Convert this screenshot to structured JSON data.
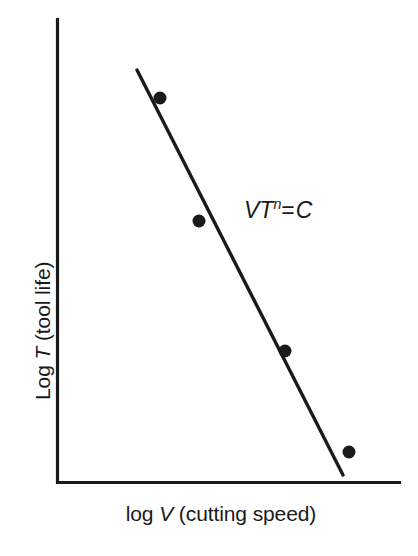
{
  "chart_data": {
    "type": "line",
    "title": "",
    "subtitle": "",
    "xlabel": "log V (cutting speed)",
    "ylabel": "Log T (tool life)",
    "xlabel_parts": {
      "prefix": "log ",
      "variable": "V",
      "suffix": " (cutting speed)"
    },
    "ylabel_parts": {
      "prefix": "Log ",
      "variable": "T",
      "suffix": " (tool life)"
    },
    "grid": false,
    "legend": null,
    "axis_ticks": {
      "x": [],
      "y": []
    },
    "axis_tick_labels": {
      "x": [],
      "y": []
    },
    "xlim": [
      0,
      1
    ],
    "ylim": [
      0,
      1
    ],
    "annotations": [
      {
        "name": "taylor-equation",
        "text": "VT^n = C",
        "parts": {
          "v": "V",
          "t": "T",
          "exponent": "n",
          "equals": "=",
          "constant": "C"
        },
        "x_px": 244,
        "y_px": 199
      }
    ],
    "series": [
      {
        "name": "fitted-trend-line",
        "type": "line",
        "style": "solid",
        "color": "#1a1a1a",
        "width_px": 3.4,
        "points_px": [
          {
            "x": 137,
            "y": 70
          },
          {
            "x": 343,
            "y": 475
          }
        ],
        "points_normalized": [
          {
            "x": 0.236,
            "y": 0.888
          },
          {
            "x": 0.833,
            "y": 0.017
          }
        ]
      },
      {
        "name": "measured-data-points",
        "type": "scatter",
        "marker": "filled-circle",
        "color": "#1a1a1a",
        "marker_size_px": 13,
        "points_px": [
          {
            "x": 160,
            "y": 98
          },
          {
            "x": 199,
            "y": 221
          },
          {
            "x": 285,
            "y": 351
          },
          {
            "x": 349,
            "y": 452
          }
        ],
        "points_normalized": [
          {
            "x": 0.302,
            "y": 0.828
          },
          {
            "x": 0.415,
            "y": 0.564
          },
          {
            "x": 0.665,
            "y": 0.284
          },
          {
            "x": 0.851,
            "y": 0.067
          }
        ]
      }
    ],
    "axes_geometry": {
      "origin_px": {
        "x": 56,
        "y": 483
      },
      "y_axis_top_px": 18,
      "x_axis_right_px": 400,
      "axis_color": "#1a1a1a",
      "axis_width_px": 3.2
    },
    "colors": {
      "background": "#ffffff",
      "foreground": "#1a1a1a"
    }
  }
}
